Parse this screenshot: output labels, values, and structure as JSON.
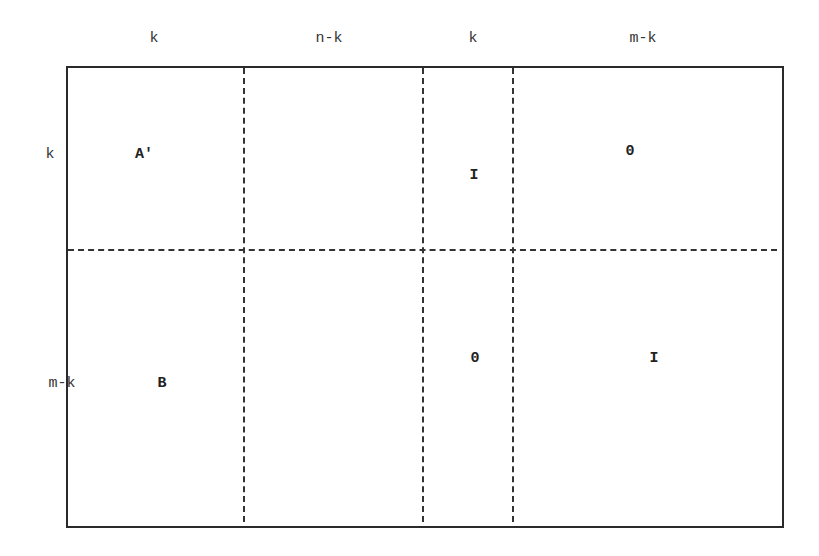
{
  "diagram": {
    "column_labels": [
      "k",
      "n-k",
      "k",
      "m-k"
    ],
    "row_labels": [
      "k",
      "m-k"
    ],
    "blocks": {
      "top_left": "A′",
      "top_identity": "I",
      "top_right": "0",
      "bottom_left": "B",
      "bottom_zero": "0",
      "bottom_right": "I"
    },
    "line_color": "#2a2a2a"
  }
}
